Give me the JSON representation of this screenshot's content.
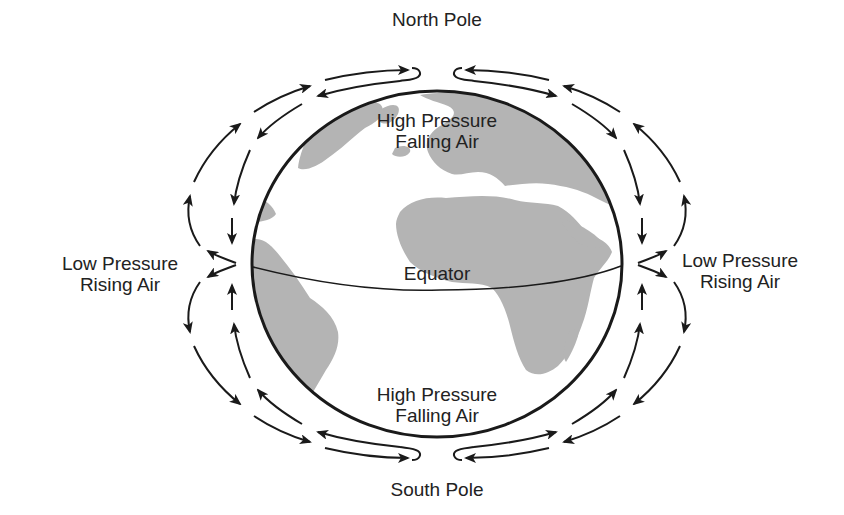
{
  "diagram": {
    "type": "global-atmospheric-circulation",
    "labels": {
      "north_pole": "North Pole",
      "south_pole": "South Pole",
      "equator": "Equator",
      "high_north": {
        "line1": "High Pressure",
        "line2": "Falling Air"
      },
      "high_south": {
        "line1": "High Pressure",
        "line2": "Falling Air"
      },
      "low_left": {
        "line1": "Low Pressure",
        "line2": "Rising Air"
      },
      "low_right": {
        "line1": "Low Pressure",
        "line2": "Rising Air"
      }
    },
    "colors": {
      "background": "#ffffff",
      "land": "#b4b4b4",
      "ocean": "#ffffff",
      "lines": "#1a1a1a",
      "text": "#222222"
    },
    "globe": {
      "cx": 437,
      "cy": 264,
      "rx": 185,
      "ry": 173
    },
    "circulation": [
      {
        "cell": "northern-left",
        "outer_flow": "equator-to-pole (rising, aloft)",
        "inner_flow": "pole-to-equator (surface)"
      },
      {
        "cell": "northern-right",
        "outer_flow": "equator-to-pole (rising, aloft)",
        "inner_flow": "pole-to-equator (surface)"
      },
      {
        "cell": "southern-left",
        "outer_flow": "equator-to-pole (rising, aloft)",
        "inner_flow": "pole-to-equator (surface)"
      },
      {
        "cell": "southern-right",
        "outer_flow": "equator-to-pole (rising, aloft)",
        "inner_flow": "pole-to-equator (surface)"
      }
    ]
  }
}
